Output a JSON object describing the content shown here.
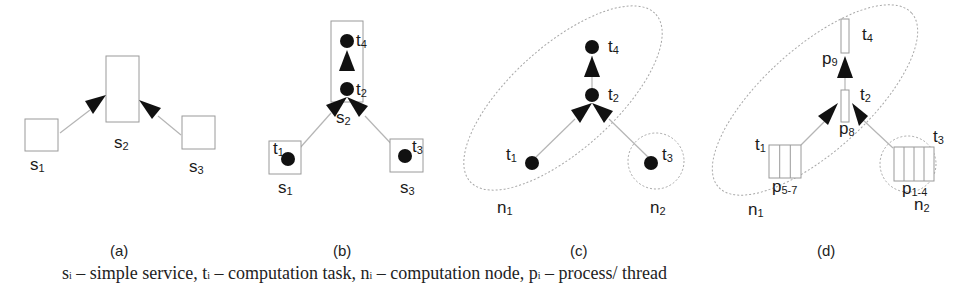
{
  "panels": [
    {
      "id": "a",
      "caption": "(a)",
      "services": [
        {
          "name": "s",
          "sub": "1"
        },
        {
          "name": "s",
          "sub": "2"
        },
        {
          "name": "s",
          "sub": "3"
        }
      ]
    },
    {
      "id": "b",
      "caption": "(b)",
      "services": [
        {
          "name": "s",
          "sub": "1"
        },
        {
          "name": "s",
          "sub": "2"
        },
        {
          "name": "s",
          "sub": "3"
        }
      ],
      "tasks": [
        {
          "name": "t",
          "sub": "1"
        },
        {
          "name": "t",
          "sub": "2"
        },
        {
          "name": "t",
          "sub": "3"
        },
        {
          "name": "t",
          "sub": "4"
        }
      ]
    },
    {
      "id": "c",
      "caption": "(c)",
      "tasks": [
        {
          "name": "t",
          "sub": "1"
        },
        {
          "name": "t",
          "sub": "2"
        },
        {
          "name": "t",
          "sub": "3"
        },
        {
          "name": "t",
          "sub": "4"
        }
      ],
      "nodes": [
        {
          "name": "n",
          "sub": "1"
        },
        {
          "name": "n",
          "sub": "2"
        }
      ]
    },
    {
      "id": "d",
      "caption": "(d)",
      "tasks": [
        {
          "name": "t",
          "sub": "1"
        },
        {
          "name": "t",
          "sub": "2"
        },
        {
          "name": "t",
          "sub": "3"
        },
        {
          "name": "t",
          "sub": "4"
        }
      ],
      "processes": [
        {
          "name": "p",
          "sub": "5-7"
        },
        {
          "name": "p",
          "sub": "8"
        },
        {
          "name": "p",
          "sub": "1-4"
        },
        {
          "name": "p",
          "sub": "9"
        }
      ],
      "nodes": [
        {
          "name": "n",
          "sub": "1"
        },
        {
          "name": "n",
          "sub": "2"
        }
      ]
    }
  ],
  "legend": [
    {
      "sym": "s",
      "sub": "i",
      "text": " – simple service, "
    },
    {
      "sym": "t",
      "sub": "i",
      "text": " – computation task, "
    },
    {
      "sym": "n",
      "sub": "i",
      "text": " – computation node, "
    },
    {
      "sym": "p",
      "sub": "i",
      "text": " – process/ thread"
    }
  ]
}
